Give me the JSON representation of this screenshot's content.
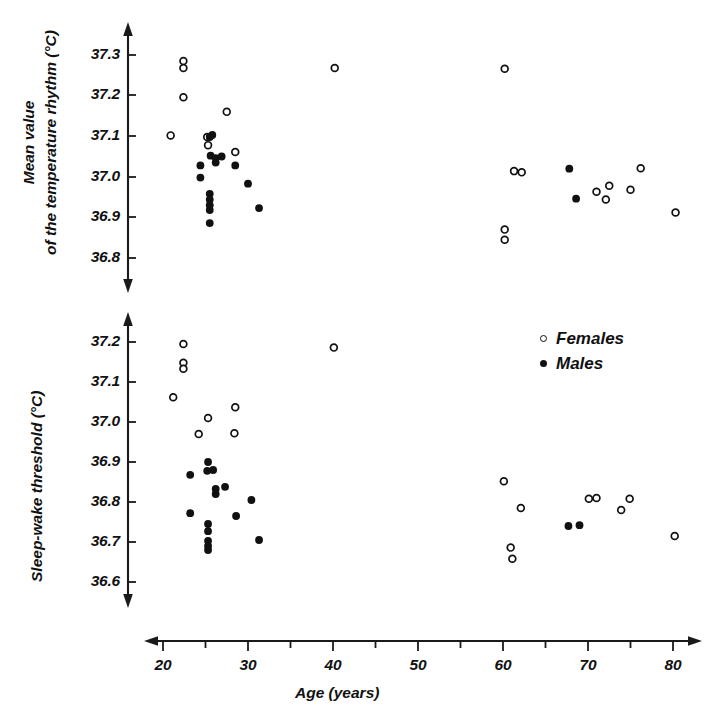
{
  "figure": {
    "background": "#ffffff",
    "ink_color": "#111111"
  },
  "legend": {
    "position": "top-right of lower panel",
    "entries": [
      {
        "label": "Females",
        "marker": "open-circle"
      },
      {
        "label": "Males",
        "marker": "filled-circle"
      }
    ]
  },
  "xaxis": {
    "label": "Age (years)",
    "ticks": [
      "20",
      "30",
      "40",
      "50",
      "60",
      "70",
      "80"
    ],
    "minor_ticks": true,
    "range": [
      17,
      83
    ],
    "arrows": "both"
  },
  "chart_data": [
    {
      "type": "scatter",
      "panel": "top",
      "title": "",
      "xlabel": "Age (years)",
      "ylabel": "Mean value of the temperature rhythm (°C)",
      "ylabel_lines": [
        "Mean value",
        "of the temperature rhythm (°C)"
      ],
      "xlim": [
        17,
        83
      ],
      "ylim": [
        36.74,
        37.36
      ],
      "yticks": [
        "37.3",
        "37.2",
        "37.1",
        "37.0",
        "36.9",
        "36.8"
      ],
      "ytick_values": [
        37.3,
        37.2,
        37.1,
        37.0,
        36.9,
        36.8
      ],
      "xticks": [
        "20",
        "30",
        "40",
        "50",
        "60",
        "70",
        "80"
      ],
      "grid": false,
      "legend_position": "none",
      "series": [
        {
          "name": "Females",
          "marker": "open-circle",
          "points": [
            [
              22.4,
              37.285
            ],
            [
              22.4,
              37.268
            ],
            [
              22.4,
              37.196
            ],
            [
              20.9,
              37.102
            ],
            [
              27.5,
              37.16
            ],
            [
              25.2,
              37.098
            ],
            [
              25.3,
              37.078
            ],
            [
              28.5,
              37.061
            ],
            [
              40.2,
              37.268
            ],
            [
              60.2,
              37.266
            ],
            [
              60.2,
              36.87
            ],
            [
              60.2,
              36.845
            ],
            [
              62.2,
              37.011
            ],
            [
              61.3,
              37.014
            ],
            [
              71.0,
              36.963
            ],
            [
              72.1,
              36.944
            ],
            [
              72.5,
              36.978
            ],
            [
              75.0,
              36.968
            ],
            [
              76.2,
              37.021
            ],
            [
              80.3,
              36.912
            ]
          ]
        },
        {
          "name": "Males",
          "marker": "filled-circle",
          "points": [
            [
              24.4,
              37.028
            ],
            [
              24.4,
              36.998
            ],
            [
              25.5,
              37.098
            ],
            [
              25.8,
              37.103
            ],
            [
              25.6,
              37.052
            ],
            [
              26.2,
              37.046
            ],
            [
              26.2,
              37.035
            ],
            [
              26.9,
              37.05
            ],
            [
              25.5,
              36.958
            ],
            [
              25.5,
              36.944
            ],
            [
              25.5,
              36.93
            ],
            [
              25.5,
              36.918
            ],
            [
              25.5,
              36.886
            ],
            [
              28.5,
              37.028
            ],
            [
              30.0,
              36.983
            ],
            [
              31.3,
              36.923
            ],
            [
              67.8,
              37.02
            ],
            [
              68.6,
              36.946
            ]
          ]
        }
      ]
    },
    {
      "type": "scatter",
      "panel": "bottom",
      "title": "",
      "xlabel": "Age (years)",
      "ylabel": "Sleep-wake threshold (°C)",
      "xlim": [
        17,
        83
      ],
      "ylim": [
        36.55,
        37.25
      ],
      "yticks": [
        "37.2",
        "37.1",
        "37.0",
        "36.9",
        "36.8",
        "36.7",
        "36.6"
      ],
      "ytick_values": [
        37.2,
        37.1,
        37.0,
        36.9,
        36.8,
        36.7,
        36.6
      ],
      "xticks": [
        "20",
        "30",
        "40",
        "50",
        "60",
        "70",
        "80"
      ],
      "grid": false,
      "legend_position": "upper-right",
      "series": [
        {
          "name": "Females",
          "marker": "open-circle",
          "points": [
            [
              22.4,
              37.195
            ],
            [
              22.4,
              37.148
            ],
            [
              22.4,
              37.133
            ],
            [
              21.2,
              37.062
            ],
            [
              25.3,
              37.01
            ],
            [
              28.5,
              37.037
            ],
            [
              24.2,
              36.97
            ],
            [
              28.4,
              36.972
            ],
            [
              40.1,
              37.186
            ],
            [
              60.1,
              36.852
            ],
            [
              62.1,
              36.785
            ],
            [
              60.9,
              36.686
            ],
            [
              61.1,
              36.658
            ],
            [
              70.1,
              36.808
            ],
            [
              71.0,
              36.81
            ],
            [
              74.9,
              36.808
            ],
            [
              73.9,
              36.78
            ],
            [
              80.2,
              36.715
            ]
          ]
        },
        {
          "name": "Males",
          "marker": "filled-circle",
          "points": [
            [
              25.3,
              36.9
            ],
            [
              25.2,
              36.878
            ],
            [
              25.9,
              36.88
            ],
            [
              23.2,
              36.868
            ],
            [
              26.2,
              36.833
            ],
            [
              26.2,
              36.82
            ],
            [
              27.3,
              36.838
            ],
            [
              30.4,
              36.805
            ],
            [
              23.2,
              36.772
            ],
            [
              28.6,
              36.765
            ],
            [
              25.3,
              36.745
            ],
            [
              25.3,
              36.727
            ],
            [
              25.3,
              36.703
            ],
            [
              25.3,
              36.69
            ],
            [
              25.3,
              36.68
            ],
            [
              31.3,
              36.705
            ],
            [
              67.7,
              36.74
            ],
            [
              69.0,
              36.742
            ]
          ]
        }
      ]
    }
  ]
}
